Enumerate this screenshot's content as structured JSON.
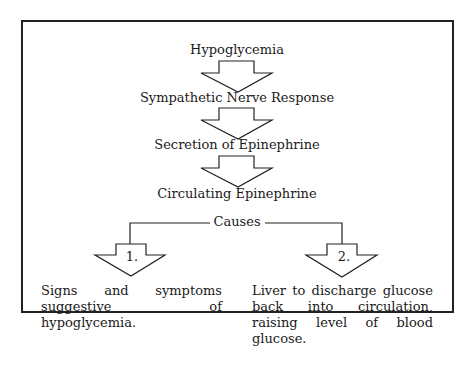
{
  "steps": [
    {
      "label": "Hypoglycemia"
    },
    {
      "label": "Sympathetic Nerve Response"
    },
    {
      "label": "Secretion of Epinephrine"
    },
    {
      "label": "Circulating Epinephrine"
    }
  ],
  "branch_label": "Causes",
  "outcomes": [
    {
      "number": "1.",
      "text": "Signs and symptoms suggestive of hypoglycemia."
    },
    {
      "number": "2.",
      "text": "Liver to discharge glucose back into circulation, raising level of blood glucose."
    }
  ]
}
